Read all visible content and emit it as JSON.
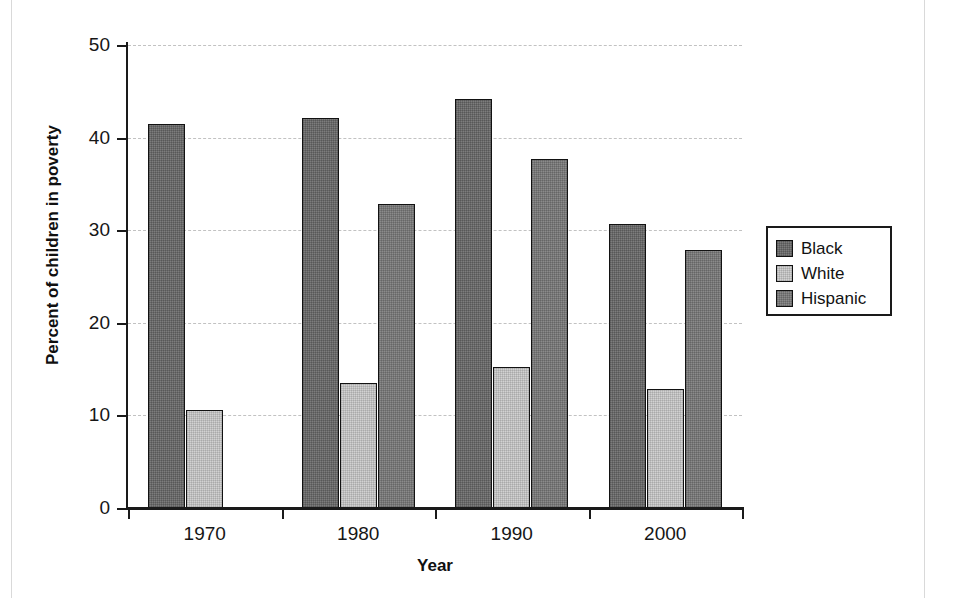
{
  "chart_data": {
    "type": "bar",
    "title": "",
    "xlabel": "Year",
    "ylabel": "Percent of children in poverty",
    "categories": [
      "1970",
      "1980",
      "1990",
      "2000"
    ],
    "series": [
      {
        "name": "Black",
        "color": "#7d7d7d",
        "values": [
          41.5,
          42.1,
          44.2,
          30.7
        ]
      },
      {
        "name": "White",
        "color": "#d2d2d2",
        "values": [
          10.6,
          13.5,
          15.2,
          12.9
        ]
      },
      {
        "name": "Hispanic",
        "color": "#8b8b8b",
        "values": [
          null,
          32.8,
          37.7,
          27.9
        ]
      }
    ],
    "ylim": [
      0,
      50
    ],
    "y_ticks": [
      "0",
      "10",
      "20",
      "30",
      "40",
      "50"
    ],
    "grid": true,
    "grid_style": "dashed-horizontal",
    "legend_position": "right"
  },
  "axes": {
    "y_tick_labels": [
      "50",
      "40",
      "30",
      "20",
      "10",
      "0"
    ],
    "x_tick_labels": [
      "1970",
      "1980",
      "1990",
      "2000"
    ],
    "y_title": "Percent of children in poverty",
    "x_title": "Year"
  },
  "legend": {
    "items": [
      {
        "label": "Black",
        "swatch": "swatch-black"
      },
      {
        "label": "White",
        "swatch": "swatch-white"
      },
      {
        "label": "Hispanic",
        "swatch": "swatch-hispanic"
      }
    ]
  }
}
